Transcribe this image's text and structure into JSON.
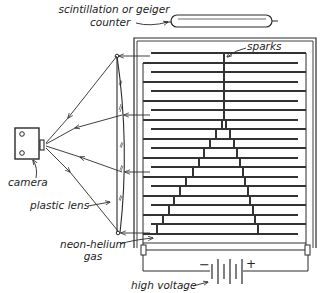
{
  "labels": {
    "counter_line1": "scintillation or geiger",
    "counter_line2": "counter",
    "sparks": "sparks",
    "camera": "camera",
    "lens": "plastic lens",
    "gas_line1": "neon-helium",
    "gas_line2": "gas",
    "voltage": "high voltage",
    "minus": "−",
    "plus": "+"
  },
  "colors": {
    "ink": "#2a2a2a",
    "plate": "#333333",
    "background": "#ffffff"
  },
  "components": [
    {
      "name": "geiger-counter-tube"
    },
    {
      "name": "spark-chamber-frame"
    },
    {
      "name": "parallel-plates",
      "count": 20
    },
    {
      "name": "plastic-lens"
    },
    {
      "name": "camera"
    },
    {
      "name": "battery"
    }
  ]
}
